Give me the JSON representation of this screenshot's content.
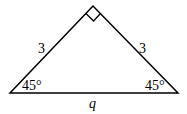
{
  "diagram": {
    "type": "right-isosceles-triangle",
    "vertices": {
      "apex": [
        93,
        6
      ],
      "left": [
        10,
        93
      ],
      "right": [
        178,
        93
      ]
    },
    "right_angle_marker": "apex",
    "labels": {
      "left_leg": "3",
      "right_leg": "3",
      "left_angle": "45°",
      "right_angle": "45°",
      "hypotenuse": "q"
    },
    "stroke_color": "#000000"
  }
}
